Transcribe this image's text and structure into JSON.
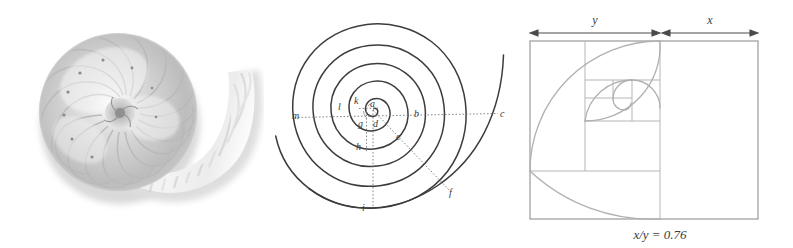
{
  "figure": {
    "background_color": "#ffffff",
    "panels": [
      {
        "id": "shell-photo",
        "name": "nautilus-shell-photograph"
      },
      {
        "id": "logarithmic-spiral",
        "name": "labeled-logarithmic-spiral-diagram"
      },
      {
        "id": "golden-rectangle",
        "name": "golden-rectangle-fibonacci-spiral-diagram"
      }
    ]
  },
  "shell_panel": {
    "alt": "grayscale cross-section of a nautilus shell showing chambered logarithmic spiral",
    "tone_light": "#f2f2f2",
    "tone_mid": "#c9c9c9",
    "tone_dark": "#a0a0a0"
  },
  "spiral_panel": {
    "stroke_curve": "#3c3c3c",
    "stroke_dotted": "#7a7a7a",
    "label_color": "#3a3a3a",
    "pole": {
      "x": 373,
      "y": 110
    },
    "labels": [
      {
        "key": "a",
        "text": "a",
        "x": 370,
        "y": 106
      },
      {
        "key": "b",
        "text": "b",
        "x": 414,
        "y": 115
      },
      {
        "key": "c",
        "text": "c",
        "x": 500,
        "y": 116
      },
      {
        "key": "d",
        "text": "d",
        "x": 374,
        "y": 126
      },
      {
        "key": "e",
        "text": "e",
        "x": 398,
        "y": 140
      },
      {
        "key": "f",
        "text": "f",
        "x": 449,
        "y": 193
      },
      {
        "key": "g",
        "text": "g",
        "x": 360,
        "y": 126
      },
      {
        "key": "h",
        "text": "h",
        "x": 358,
        "y": 150
      },
      {
        "key": "i",
        "text": "i",
        "x": 364,
        "y": 208
      },
      {
        "key": "k",
        "text": "k",
        "x": 355,
        "y": 101
      },
      {
        "key": "l",
        "text": "l",
        "x": 340,
        "y": 107
      },
      {
        "key": "m",
        "text": "m",
        "x": 294,
        "y": 115
      }
    ]
  },
  "golden_panel": {
    "rect_stroke": "#9a9a9a",
    "inner_stroke": "#b5b5b5",
    "spiral_stroke": "#b0b0b0",
    "arrow_color": "#4a4a4a",
    "label_color": "#3a3a3a",
    "dimension_y_label": "y",
    "dimension_x_label": "x",
    "caption": "x/y = 0.76",
    "ratio_value": "0.76",
    "rect": {
      "left": 530,
      "top": 41,
      "right": 758,
      "bottom": 219
    },
    "split_x": 660
  }
}
